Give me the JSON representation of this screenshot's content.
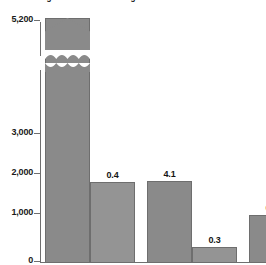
{
  "caption": "of remaining stocks is shown in figures on each column",
  "colors": {
    "bar_fill": "#8a8a8a",
    "bar_fill_light": "#949494",
    "bar_stroke": "#6e6e6e",
    "axis": "#6f6f6f",
    "text": "#141414",
    "background": "#ffffff"
  },
  "chart_data": {
    "type": "bar",
    "title": "",
    "subtitle": "",
    "xlabel": "",
    "ylabel": "",
    "categories": [
      "1",
      "2",
      "3",
      "4",
      "5",
      "6"
    ],
    "values": [
      5200,
      1550,
      1560,
      170,
      960,
      640
    ],
    "data_labels": [
      "1.5",
      "0.4",
      "4.1",
      "0.3",
      "0.8",
      "0.5"
    ],
    "ylim": [
      0,
      5200
    ],
    "yticks": [
      0,
      1000,
      2000,
      3000,
      5200
    ],
    "ytick_labels": [
      "0",
      "1,000",
      "2,000",
      "3,000",
      "5,200"
    ],
    "axis_break": true,
    "axis_break_between": [
      3000,
      5200
    ],
    "capped_bar_index": 0,
    "grid": false,
    "legend": null
  },
  "axis": {
    "ticks": [
      {
        "label": "5,200",
        "value": 5200,
        "y": 20
      },
      {
        "label": "3,000",
        "value": 3000,
        "y": 133
      },
      {
        "label": "2,000",
        "value": 2000,
        "y": 173
      },
      {
        "label": "1,000",
        "value": 1000,
        "y": 213
      },
      {
        "label": "0",
        "value": 0,
        "y": 261
      }
    ]
  },
  "bars": [
    {
      "label": "1.5",
      "x": 45,
      "w": 45,
      "top": 18,
      "h": 245,
      "capped": true,
      "label_inside": true,
      "label_x": 45,
      "label_y": 36
    },
    {
      "label": "0.4",
      "x": 90,
      "w": 45,
      "top": 182,
      "h": 81,
      "capped": false,
      "label_inside": false,
      "label_x": 90,
      "label_y": 170,
      "light": true
    },
    {
      "label": "4.1",
      "x": 147,
      "w": 45,
      "top": 181,
      "h": 82,
      "capped": false,
      "label_inside": false,
      "label_x": 147,
      "label_y": 169
    },
    {
      "label": "0.3",
      "x": 192,
      "w": 45,
      "top": 247,
      "h": 16,
      "capped": false,
      "label_inside": false,
      "label_x": 192,
      "label_y": 235,
      "light": true
    },
    {
      "label": "0.8",
      "x": 249,
      "w": 45,
      "top": 215,
      "h": 48,
      "capped": false,
      "label_inside": false,
      "label_x": 249,
      "label_y": 203
    },
    {
      "label": "0.5",
      "x": 294,
      "w": 45,
      "top": 227,
      "h": 36,
      "capped": false,
      "label_inside": false,
      "label_x": 294,
      "label_y": 215,
      "light": true
    }
  ]
}
